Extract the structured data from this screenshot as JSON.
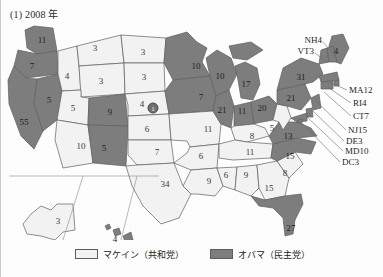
{
  "figure": {
    "title": "(1) 2008 年",
    "year": "2008"
  },
  "legend": {
    "items": [
      {
        "label": "マケイン（共和党）",
        "candidate": "McCain",
        "party": "Republican",
        "color": "#f2f2f2",
        "key": "rep"
      },
      {
        "label": "オバマ（民主党）",
        "candidate": "Obama",
        "party": "Democrat",
        "color": "#7d7d7d",
        "key": "dem"
      }
    ]
  },
  "colors": {
    "republican_fill": "#f2f2f2",
    "democrat_fill": "#7d7d7d",
    "state_border": "#5e5e5e",
    "outline": "#3f3f3f",
    "page_background": "#fdfdfd",
    "leader_line": "#6b6b6b"
  },
  "map": {
    "projection_note": "US electoral-vote choropleth with Alaska and Hawaii insets",
    "states": [
      {
        "code": "WA",
        "votes": "11",
        "winner": "dem",
        "x": 41,
        "y": 22
      },
      {
        "code": "OR",
        "votes": "7",
        "winner": "dem",
        "x": 31,
        "y": 48
      },
      {
        "code": "CA",
        "votes": "55",
        "winner": "dem",
        "x": 23,
        "y": 104
      },
      {
        "code": "NV",
        "votes": "5",
        "winner": "dem",
        "x": 48,
        "y": 82
      },
      {
        "code": "ID",
        "votes": "4",
        "winner": "rep",
        "x": 66,
        "y": 58
      },
      {
        "code": "MT",
        "votes": "3",
        "winner": "rep",
        "x": 94,
        "y": 30
      },
      {
        "code": "WY",
        "votes": "3",
        "winner": "rep",
        "x": 100,
        "y": 63
      },
      {
        "code": "UT",
        "votes": "5",
        "winner": "rep",
        "x": 72,
        "y": 90
      },
      {
        "code": "AZ",
        "votes": "10",
        "winner": "rep",
        "x": 80,
        "y": 128
      },
      {
        "code": "CO",
        "votes": "9",
        "winner": "dem",
        "x": 109,
        "y": 94
      },
      {
        "code": "NM",
        "votes": "5",
        "winner": "dem",
        "x": 103,
        "y": 130
      },
      {
        "code": "ND",
        "votes": "3",
        "winner": "rep",
        "x": 142,
        "y": 34
      },
      {
        "code": "SD",
        "votes": "3",
        "winner": "rep",
        "x": 143,
        "y": 59
      },
      {
        "code": "NE",
        "votes": "4",
        "winner": "rep",
        "x": 141,
        "y": 86
      },
      {
        "code": "KS",
        "votes": "6",
        "winner": "rep",
        "x": 146,
        "y": 111
      },
      {
        "code": "OK",
        "votes": "7",
        "winner": "rep",
        "x": 156,
        "y": 134
      },
      {
        "code": "TX",
        "votes": "34",
        "winner": "rep",
        "x": 164,
        "y": 166
      },
      {
        "code": "MN",
        "votes": "10",
        "winner": "dem",
        "x": 195,
        "y": 48
      },
      {
        "code": "IA",
        "votes": "7",
        "winner": "dem",
        "x": 200,
        "y": 79
      },
      {
        "code": "MO",
        "votes": "11",
        "winner": "rep",
        "x": 207,
        "y": 111
      },
      {
        "code": "AR",
        "votes": "6",
        "winner": "rep",
        "x": 200,
        "y": 138
      },
      {
        "code": "LA",
        "votes": "9",
        "winner": "rep",
        "x": 208,
        "y": 163
      },
      {
        "code": "WI",
        "votes": "10",
        "winner": "dem",
        "x": 219,
        "y": 58
      },
      {
        "code": "IL",
        "votes": "21",
        "winner": "dem",
        "x": 221,
        "y": 92
      },
      {
        "code": "MS",
        "votes": "6",
        "winner": "rep",
        "x": 225,
        "y": 157
      },
      {
        "code": "MI",
        "votes": "17",
        "winner": "dem",
        "x": 245,
        "y": 66
      },
      {
        "code": "IN",
        "votes": "11",
        "winner": "dem",
        "x": 241,
        "y": 93
      },
      {
        "code": "OH",
        "votes": "20",
        "winner": "dem",
        "x": 261,
        "y": 90
      },
      {
        "code": "KY",
        "votes": "8",
        "winner": "rep",
        "x": 251,
        "y": 118
      },
      {
        "code": "TN",
        "votes": "11",
        "winner": "rep",
        "x": 249,
        "y": 134
      },
      {
        "code": "AL",
        "votes": "9",
        "winner": "rep",
        "x": 245,
        "y": 157
      },
      {
        "code": "GA",
        "votes": "15",
        "winner": "rep",
        "x": 268,
        "y": 170
      },
      {
        "code": "FL",
        "votes": "27",
        "winner": "dem",
        "x": 290,
        "y": 210
      },
      {
        "code": "SC",
        "votes": "8",
        "winner": "rep",
        "x": 284,
        "y": 155
      },
      {
        "code": "NC",
        "votes": "15",
        "winner": "dem",
        "x": 289,
        "y": 138
      },
      {
        "code": "VA",
        "votes": "13",
        "winner": "dem",
        "x": 287,
        "y": 118
      },
      {
        "code": "WV",
        "votes": "5",
        "winner": "rep",
        "x": 271,
        "y": 110
      },
      {
        "code": "PA",
        "votes": "21",
        "winner": "dem",
        "x": 290,
        "y": 80
      },
      {
        "code": "NY",
        "votes": "31",
        "winner": "dem",
        "x": 300,
        "y": 59
      },
      {
        "code": "ME",
        "votes": "4",
        "winner": "dem",
        "x": 335,
        "y": 33
      }
    ],
    "insets": [
      {
        "code": "AK",
        "name": "Alaska",
        "votes": "3",
        "winner": "rep",
        "x": 57,
        "y": 203
      },
      {
        "code": "HI",
        "name": "Hawaii",
        "votes": "4",
        "winner": "dem",
        "x": 114,
        "y": 221
      }
    ],
    "nebraska_split": {
      "label": "1",
      "winner": "dem",
      "note": "NE-2 congressional district electoral vote",
      "x": 152,
      "y": 90
    },
    "callouts": [
      {
        "text": "NH4",
        "side": "left",
        "x": 321,
        "y": 22,
        "line": {
          "x1": 322,
          "y1": 24,
          "x2": 334,
          "y2": 38
        }
      },
      {
        "text": "VT3",
        "side": "left",
        "x": 313,
        "y": 33,
        "line": {
          "x1": 314,
          "y1": 35,
          "x2": 327,
          "y2": 45
        }
      },
      {
        "text": "MA12",
        "side": "right",
        "x": 348,
        "y": 72,
        "line": {
          "x1": 346,
          "y1": 72,
          "x2": 326,
          "y2": 63
        }
      },
      {
        "text": "RI4",
        "side": "right",
        "x": 352,
        "y": 85,
        "line": {
          "x1": 350,
          "y1": 85,
          "x2": 328,
          "y2": 70
        }
      },
      {
        "text": "CT7",
        "side": "right",
        "x": 352,
        "y": 98,
        "line": {
          "x1": 350,
          "y1": 98,
          "x2": 323,
          "y2": 74
        }
      },
      {
        "text": "NJ15",
        "side": "right",
        "x": 347,
        "y": 112,
        "line": {
          "x1": 345,
          "y1": 112,
          "x2": 315,
          "y2": 83
        }
      },
      {
        "text": "DE3",
        "side": "right",
        "x": 345,
        "y": 123,
        "line": {
          "x1": 343,
          "y1": 123,
          "x2": 311,
          "y2": 92
        }
      },
      {
        "text": "MD10",
        "side": "right",
        "x": 344,
        "y": 133,
        "line": {
          "x1": 342,
          "y1": 133,
          "x2": 305,
          "y2": 98
        }
      },
      {
        "text": "DC3",
        "side": "right",
        "x": 341,
        "y": 144,
        "line": {
          "x1": 339,
          "y1": 144,
          "x2": 300,
          "y2": 104
        }
      }
    ]
  }
}
